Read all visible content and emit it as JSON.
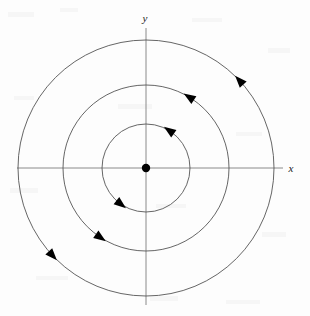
{
  "figure": {
    "width": 310,
    "height": 316,
    "background_color": "#fdfdfd"
  },
  "axes": {
    "x_label": "x",
    "y_label": "y",
    "color": "#8a8a8a",
    "origin": {
      "x": 146,
      "y": 168
    },
    "x_axis": {
      "x1": 17,
      "y1": 168,
      "x2": 283,
      "y2": 168
    },
    "y_axis": {
      "x1": 146,
      "y1": 28,
      "x2": 146,
      "y2": 305
    },
    "x_label_pos": {
      "x": 291,
      "y": 172
    },
    "y_label_pos": {
      "x": 145,
      "y": 22
    }
  },
  "equilibrium_point": {
    "name": "center",
    "x": 146,
    "y": 168,
    "radius": 4.2,
    "color": "#000000"
  },
  "chart_data": {
    "type": "scatter",
    "title": "",
    "xlabel": "x",
    "ylabel": "y",
    "grid": false,
    "legend": null,
    "orbits": [
      {
        "name": "inner-orbit",
        "radius": 44,
        "direction": "counterclockwise",
        "arrow_angles_deg": [
          55,
          232
        ]
      },
      {
        "name": "middle-orbit",
        "radius": 83,
        "direction": "counterclockwise",
        "arrow_angles_deg": [
          57,
          235
        ]
      },
      {
        "name": "outer-orbit",
        "radius": 128,
        "direction": "counterclockwise",
        "arrow_angles_deg": [
          42,
          222
        ]
      }
    ],
    "orbit_color": "#555555",
    "arrow_color": "#000000"
  }
}
